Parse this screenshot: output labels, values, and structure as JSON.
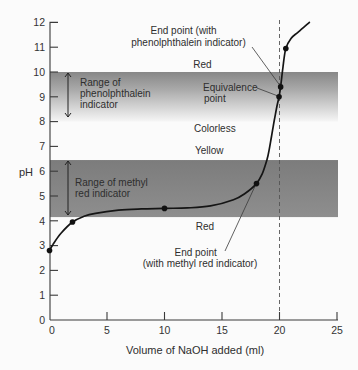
{
  "chart_data": {
    "type": "line",
    "title": "",
    "xlabel": "Volume of NaOH added (ml)",
    "ylabel": "pH",
    "xlim": [
      0,
      25
    ],
    "ylim": [
      0,
      12
    ],
    "grid": false,
    "xticks": [
      0,
      5,
      10,
      15,
      20,
      25
    ],
    "yticks": [
      0,
      1,
      2,
      3,
      4,
      5,
      6,
      7,
      8,
      9,
      10,
      11,
      12
    ],
    "series": [
      {
        "name": "Titration curve",
        "x": [
          0,
          0.3,
          1,
          2,
          3,
          4,
          6,
          8,
          10,
          12,
          14,
          16,
          17,
          18,
          18.5,
          18.9,
          19.1,
          19.3,
          19.55,
          19.8,
          19.96,
          20.1,
          20.3,
          20.55,
          21.0,
          21.6,
          22.6
        ],
        "y": [
          2.8,
          3.05,
          3.5,
          3.95,
          4.18,
          4.3,
          4.43,
          4.48,
          4.5,
          4.52,
          4.6,
          4.85,
          5.1,
          5.5,
          5.9,
          6.45,
          6.85,
          7.4,
          8.06,
          8.67,
          9.0,
          9.4,
          10.2,
          10.95,
          11.35,
          11.6,
          12.0
        ]
      }
    ],
    "marked_points": [
      {
        "x": 0,
        "y": 2.8
      },
      {
        "x": 2,
        "y": 3.95
      },
      {
        "x": 10,
        "y": 4.5
      },
      {
        "x": 18,
        "y": 5.5
      },
      {
        "x": 19.96,
        "y": 9.0
      },
      {
        "x": 20.1,
        "y": 9.4
      },
      {
        "x": 20.55,
        "y": 10.95
      }
    ],
    "bands": [
      {
        "name": "phenolphthalein",
        "from": 8.0,
        "to": 10.0,
        "style": "gradient-fade",
        "color_top": "#878787",
        "color_bottom": "#f6f6f6"
      },
      {
        "name": "methyl-red",
        "from": 4.15,
        "to": 6.45,
        "style": "solid",
        "color_top": "#7c7c7c",
        "color_bottom": "#8e8e8e"
      }
    ],
    "vline": {
      "x": 20,
      "style": "dashed"
    },
    "annotations": {
      "phenol_range": [
        "Range of",
        "phenolphthalein",
        "indicator"
      ],
      "methyl_range": [
        "Range of methyl",
        "red indicator"
      ],
      "phenol_endpoint": [
        "End point (with",
        "phenolphthalein indicator)"
      ],
      "equivalence": [
        "Equivalence",
        "point"
      ],
      "methyl_endpoint": [
        "End point",
        "(with methyl red indicator)"
      ],
      "color_red_top": "Red",
      "color_colorless": "Colorless",
      "color_yellow": "Yellow",
      "color_red_bottom": "Red"
    }
  }
}
